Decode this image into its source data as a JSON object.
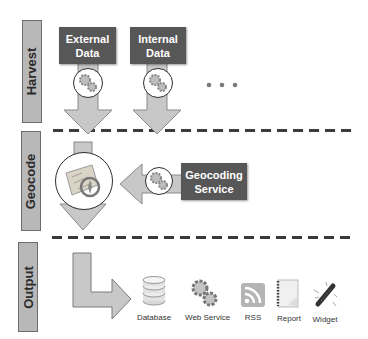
{
  "stages": [
    {
      "id": "harvest",
      "label": "Harvest"
    },
    {
      "id": "geocode",
      "label": "Geocode"
    },
    {
      "id": "output",
      "label": "Output"
    }
  ],
  "harvest": {
    "sources": [
      {
        "line1": "External",
        "line2": "Data",
        "icon": "gears-icon"
      },
      {
        "line1": "Internal",
        "line2": "Data",
        "icon": "gears-icon"
      }
    ],
    "more_indicator": "ellipsis-dots"
  },
  "geocode": {
    "center_icon": "map-compass-icon",
    "service": {
      "line1": "Geocoding",
      "line2": "Service",
      "icon": "gears-icon"
    }
  },
  "output": {
    "targets": [
      {
        "label": "Database",
        "icon": "database-icon"
      },
      {
        "label": "Web Service",
        "icon": "gears-icon"
      },
      {
        "label": "RSS",
        "icon": "rss-icon"
      },
      {
        "label": "Report",
        "icon": "report-icon"
      },
      {
        "label": "Widget",
        "icon": "widget-icon"
      }
    ]
  },
  "colors": {
    "box_dark": "#575757",
    "arrow_fill": "#c8c8c8",
    "label_fill": "#b8b8b8",
    "dash": "#3b3b3b"
  }
}
